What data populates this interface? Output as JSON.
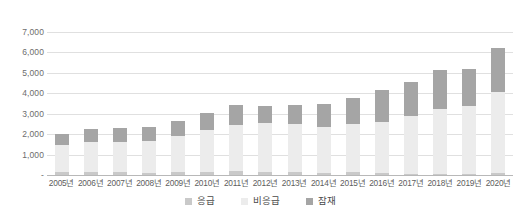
{
  "chart_data": {
    "type": "bar",
    "title": "",
    "subtitle": "",
    "xlabel": "",
    "ylabel": "",
    "stacked": true,
    "grid": true,
    "legend_position": "bottom",
    "ylim": [
      0,
      7000
    ],
    "ytick_labels": [
      "7,000",
      "6,000",
      "5,000",
      "4,000",
      "3,000",
      "2,000",
      "1,000",
      "-"
    ],
    "ytick_values": [
      7000,
      6000,
      5000,
      4000,
      3000,
      2000,
      1000,
      0
    ],
    "categories": [
      "2005년",
      "2006년",
      "2007년",
      "2008년",
      "2009년",
      "2010년",
      "2011년",
      "2012년",
      "2013년",
      "2014년",
      "2015년",
      "2016년",
      "2017년",
      "2018년",
      "2019년",
      "2020년"
    ],
    "series": [
      {
        "name": "응급",
        "color": "#c9c9c9",
        "values": [
          130,
          130,
          130,
          120,
          150,
          140,
          180,
          170,
          140,
          110,
          130,
          80,
          70,
          70,
          60,
          80
        ]
      },
      {
        "name": "비응급",
        "color": "#ececec",
        "values": [
          1320,
          1480,
          1500,
          1560,
          1780,
          2070,
          2290,
          2370,
          2370,
          2230,
          2360,
          2500,
          2840,
          3180,
          3300,
          3970
        ]
      },
      {
        "name": "잠재",
        "color": "#a5a5a5",
        "values": [
          550,
          640,
          670,
          650,
          700,
          820,
          950,
          860,
          900,
          1120,
          1290,
          1600,
          1650,
          1880,
          1810,
          2150
        ]
      }
    ],
    "totals": [
      2000,
      2250,
      2300,
      2330,
      2630,
      3030,
      3420,
      3400,
      3410,
      3460,
      3780,
      4180,
      4560,
      5130,
      5170,
      6200
    ]
  },
  "legend": {
    "items": [
      {
        "label": "응급",
        "color": "#c9c9c9"
      },
      {
        "label": "비응급",
        "color": "#ececec"
      },
      {
        "label": "잠재",
        "color": "#a5a5a5"
      }
    ]
  }
}
